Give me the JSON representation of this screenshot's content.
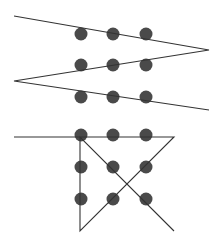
{
  "diagram": {
    "colors": {
      "dot": "#4a4a4a",
      "line": "#333333",
      "background": "#ffffff"
    },
    "puzzles": [
      {
        "name": "three-line-solution",
        "dots": [
          [
            81,
            34
          ],
          [
            113,
            34
          ],
          [
            146,
            34
          ],
          [
            81,
            65
          ],
          [
            113,
            65
          ],
          [
            146,
            65
          ],
          [
            81,
            97
          ],
          [
            113,
            97
          ],
          [
            146,
            97
          ]
        ],
        "path": [
          [
            14,
            16
          ],
          [
            209,
            50
          ],
          [
            14,
            81
          ],
          [
            209,
            110
          ]
        ]
      },
      {
        "name": "four-line-solution",
        "dots": [
          [
            81,
            135
          ],
          [
            113,
            135
          ],
          [
            146,
            135
          ],
          [
            81,
            167
          ],
          [
            113,
            167
          ],
          [
            146,
            167
          ],
          [
            81,
            199
          ],
          [
            113,
            199
          ],
          [
            146,
            199
          ]
        ],
        "path": [
          [
            14,
            137
          ],
          [
            174,
            137
          ],
          [
            80,
            231
          ],
          [
            80,
            137
          ],
          [
            174,
            231
          ]
        ]
      }
    ]
  }
}
